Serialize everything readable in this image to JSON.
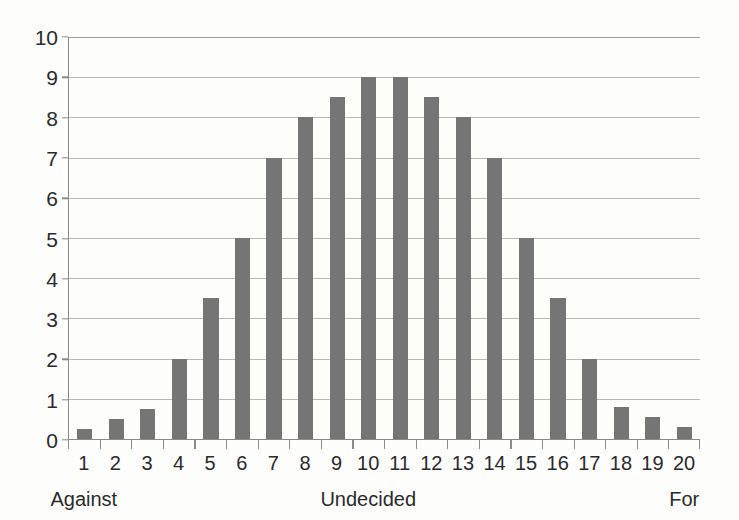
{
  "chart_data": {
    "type": "bar",
    "title": "",
    "subtitle": "",
    "xlabel": "",
    "ylabel": "",
    "categories": [
      "1",
      "2",
      "3",
      "4",
      "5",
      "6",
      "7",
      "8",
      "9",
      "10",
      "11",
      "12",
      "13",
      "14",
      "15",
      "16",
      "17",
      "18",
      "19",
      "20"
    ],
    "values": [
      0.25,
      0.5,
      0.75,
      2,
      3.5,
      5,
      7,
      8,
      8.5,
      9,
      9,
      8.5,
      8,
      7,
      5,
      3.5,
      2,
      0.8,
      0.55,
      0.3
    ],
    "series": [
      {
        "name": "Responses",
        "values": [
          0.25,
          0.5,
          0.75,
          2,
          3.5,
          5,
          7,
          8,
          8.5,
          9,
          9,
          8.5,
          8,
          7,
          5,
          3.5,
          2,
          0.8,
          0.55,
          0.3
        ]
      }
    ],
    "ylim": [
      0,
      10
    ],
    "y_ticks": [
      0,
      1,
      2,
      3,
      4,
      5,
      6,
      7,
      8,
      9,
      10
    ],
    "y_tick_labels": [
      "0",
      "1",
      "2",
      "3",
      "4",
      "5",
      "6",
      "7",
      "8",
      "9",
      "10"
    ],
    "grid": true,
    "grid_axis": "y",
    "legend": false,
    "legend_position": "none",
    "bar_color": "#757575",
    "grid_color": "#b9b9b9",
    "axis_color": "#8a8a8a",
    "background_color": "#fdfdfc",
    "text_color": "#2b2b2b",
    "annotations": [
      {
        "text": "Against",
        "category": "1",
        "position": "below-axis"
      },
      {
        "text": "Undecided",
        "category": "10",
        "position": "below-axis"
      },
      {
        "text": "For",
        "category": "20",
        "position": "below-axis"
      }
    ]
  }
}
